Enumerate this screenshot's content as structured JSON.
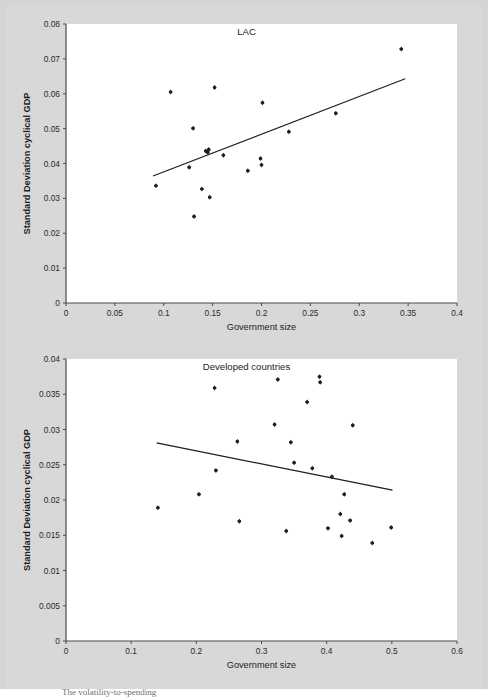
{
  "figure": {
    "background_color": "#d8d8d8",
    "plot_background_color": "#ffffff",
    "marker_color": "#1f1f1f",
    "line_color": "#1d1d1d",
    "axis_color": "#4a4a4a",
    "caption_partial": "The volatility-to-spending"
  },
  "chart_data": [
    {
      "type": "scatter",
      "title": "LAC",
      "xlabel": "Government size",
      "ylabel": "Standard Deviation cyclical GDP",
      "xlim": [
        0,
        0.4
      ],
      "ylim": [
        0,
        0.08
      ],
      "xticks": [
        0,
        0.05,
        0.1,
        0.15,
        0.2,
        0.25,
        0.3,
        0.35,
        0.4
      ],
      "xtick_labels": [
        "0",
        "0.05",
        "0.1",
        "0.15",
        "0.2",
        "0.25",
        "0.3",
        "0.35",
        "0.4"
      ],
      "yticks": [
        0,
        0.01,
        0.02,
        0.03,
        0.04,
        0.05,
        0.06,
        0.07,
        0.08
      ],
      "ytick_labels": [
        "0",
        "0.01",
        "0.02",
        "0.03",
        "0.04",
        "0.05",
        "0.06",
        "0.07",
        "0.08"
      ],
      "grid": false,
      "legend": "none",
      "points": [
        {
          "x": 0.092,
          "y": 0.0336
        },
        {
          "x": 0.107,
          "y": 0.0605
        },
        {
          "x": 0.126,
          "y": 0.0389
        },
        {
          "x": 0.13,
          "y": 0.0501
        },
        {
          "x": 0.131,
          "y": 0.0248
        },
        {
          "x": 0.139,
          "y": 0.0327
        },
        {
          "x": 0.143,
          "y": 0.0436
        },
        {
          "x": 0.145,
          "y": 0.0432
        },
        {
          "x": 0.146,
          "y": 0.044
        },
        {
          "x": 0.147,
          "y": 0.0303
        },
        {
          "x": 0.152,
          "y": 0.0618
        },
        {
          "x": 0.161,
          "y": 0.0424
        },
        {
          "x": 0.186,
          "y": 0.0379
        },
        {
          "x": 0.199,
          "y": 0.0414
        },
        {
          "x": 0.2,
          "y": 0.0396
        },
        {
          "x": 0.201,
          "y": 0.0574
        },
        {
          "x": 0.228,
          "y": 0.0491
        },
        {
          "x": 0.276,
          "y": 0.0544
        },
        {
          "x": 0.343,
          "y": 0.0728
        }
      ],
      "trendline": {
        "x0": 0.089,
        "y0": 0.0364,
        "x1": 0.347,
        "y1": 0.0643,
        "slope_sign": "positive"
      }
    },
    {
      "type": "scatter",
      "title": "Developed countries",
      "xlabel": "Government size",
      "ylabel": "Standard Deviation cyclical GDP",
      "xlim": [
        0,
        0.6
      ],
      "ylim": [
        0,
        0.04
      ],
      "xticks": [
        0,
        0.1,
        0.2,
        0.3,
        0.4,
        0.5,
        0.6
      ],
      "xtick_labels": [
        "0",
        "0.1",
        "0.2",
        "0.3",
        "0.4",
        "0.5",
        "0.6"
      ],
      "yticks": [
        0,
        0.005,
        0.01,
        0.015,
        0.02,
        0.025,
        0.03,
        0.035,
        0.04
      ],
      "ytick_labels": [
        "0",
        "0.005",
        "0.01",
        "0.015",
        "0.02",
        "0.025",
        "0.03",
        "0.035",
        "0.04"
      ],
      "grid": false,
      "legend": "none",
      "points": [
        {
          "x": 0.141,
          "y": 0.0189
        },
        {
          "x": 0.204,
          "y": 0.0208
        },
        {
          "x": 0.228,
          "y": 0.0359
        },
        {
          "x": 0.23,
          "y": 0.0242
        },
        {
          "x": 0.263,
          "y": 0.0283
        },
        {
          "x": 0.266,
          "y": 0.017
        },
        {
          "x": 0.32,
          "y": 0.0307
        },
        {
          "x": 0.325,
          "y": 0.0371
        },
        {
          "x": 0.338,
          "y": 0.0156
        },
        {
          "x": 0.345,
          "y": 0.0282
        },
        {
          "x": 0.35,
          "y": 0.0253
        },
        {
          "x": 0.37,
          "y": 0.0339
        },
        {
          "x": 0.378,
          "y": 0.0245
        },
        {
          "x": 0.389,
          "y": 0.0375
        },
        {
          "x": 0.39,
          "y": 0.0367
        },
        {
          "x": 0.402,
          "y": 0.016
        },
        {
          "x": 0.408,
          "y": 0.0233
        },
        {
          "x": 0.421,
          "y": 0.018
        },
        {
          "x": 0.423,
          "y": 0.0149
        },
        {
          "x": 0.427,
          "y": 0.0208
        },
        {
          "x": 0.436,
          "y": 0.0171
        },
        {
          "x": 0.44,
          "y": 0.0306
        },
        {
          "x": 0.47,
          "y": 0.0139
        },
        {
          "x": 0.499,
          "y": 0.0161
        }
      ],
      "trendline": {
        "x0": 0.139,
        "y0": 0.0281,
        "x1": 0.501,
        "y1": 0.0214,
        "slope_sign": "negative"
      }
    }
  ]
}
